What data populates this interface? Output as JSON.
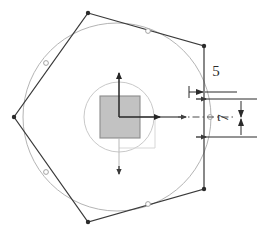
{
  "drawing": {
    "title": "cross-section-tolerance-diagram",
    "type": "technical-engineering-drawing",
    "background_color": "#ffffff",
    "canvas": {
      "width": 260,
      "height": 235
    }
  },
  "colors": {
    "outline": "#3a3a3a",
    "circle_light": "#b4b4b4",
    "inner_circle": "#c9c9c9",
    "square_fill": "#c2c2c2",
    "square_border": "#8c8c8c",
    "axis": "#262626",
    "dimension": "#2b2b2b",
    "centerline": "#4a4a4a",
    "marker": "#9a9a9a"
  },
  "geometry": {
    "center": {
      "x": 119,
      "y": 117
    },
    "outer_circle": {
      "cx": 117,
      "cy": 117,
      "r": 94
    },
    "inner_circle": {
      "cx": 119,
      "cy": 117,
      "r": 35
    },
    "polygon_points": "88,13 204,46 204,189 88,222 14,117",
    "polygon_vertices": [
      {
        "x": 88,
        "y": 13,
        "label": "vertex-top"
      },
      {
        "x": 204,
        "y": 46,
        "label": "vertex-upper-right"
      },
      {
        "x": 204,
        "y": 189,
        "label": "vertex-lower-right"
      },
      {
        "x": 88,
        "y": 222,
        "label": "vertex-bottom"
      },
      {
        "x": 14,
        "y": 117,
        "label": "vertex-left"
      }
    ],
    "circle_markers": [
      {
        "x": 148,
        "y": 31,
        "label": "marker-top-right"
      },
      {
        "x": 46,
        "y": 63,
        "label": "marker-upper-left"
      },
      {
        "x": 46,
        "y": 172,
        "label": "marker-lower-left"
      },
      {
        "x": 148,
        "y": 204,
        "label": "marker-bottom-right"
      },
      {
        "x": 210,
        "y": 117,
        "label": "marker-right"
      }
    ],
    "inner_square": {
      "x": 100,
      "y": 96,
      "width": 40,
      "height": 42,
      "fill": "#c2c2c2"
    }
  },
  "axes": {
    "vertical": {
      "x": 119,
      "from_y": 117,
      "to_y": 71,
      "arrow": "up"
    },
    "horizontal": {
      "y": 117,
      "from_x": 119,
      "to_x": 162,
      "arrow": "right"
    },
    "vertical_dashed": {
      "x": 119,
      "from_y": 138,
      "to_y": 172,
      "arrow": "down"
    },
    "centerline": {
      "y": 117,
      "from_x": 160,
      "to_x": 232,
      "style": "dash-dot"
    }
  },
  "dimensions": [
    {
      "id": "dim-5",
      "value": "5",
      "orientation": "horizontal",
      "text_x": 222,
      "text_y": 74,
      "line_y": 92,
      "line_from_x": 189,
      "line_to_x": 230,
      "arrow_inner_x": 205
    },
    {
      "id": "dim-7",
      "value": "7",
      "orientation": "vertical-rotated",
      "text_x": 231,
      "text_y": 117,
      "line_x": 240,
      "line_from_y": 99,
      "line_to_y": 137,
      "ext_top_y": 99,
      "ext_bottom_y": 137,
      "ext_from_x": 205,
      "ext_to_x": 256
    }
  ],
  "tick_marks": [
    {
      "x": 204,
      "y": 99,
      "label": "tick-upper"
    },
    {
      "x": 204,
      "y": 137,
      "label": "tick-lower"
    },
    {
      "x": 204,
      "y": 117,
      "label": "tick-center"
    }
  ]
}
